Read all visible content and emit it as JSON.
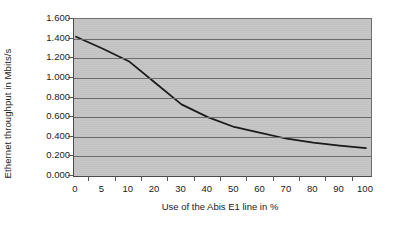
{
  "chart_data": {
    "type": "line",
    "title": "",
    "xlabel": "Use of the Abis E1 line in %",
    "ylabel": "Ethernet throughput in Mbits/s",
    "x": [
      0,
      5,
      10,
      20,
      30,
      40,
      50,
      60,
      70,
      80,
      90,
      100
    ],
    "xtick_labels": [
      "0",
      "5",
      "10",
      "20",
      "30",
      "40",
      "50",
      "60",
      "70",
      "80",
      "90",
      "100"
    ],
    "ytick_labels": [
      "1.600",
      "1.400",
      "1.200",
      "1.000",
      "0.800",
      "0.600",
      "0.400",
      "0.200",
      "0.000"
    ],
    "ytick_values": [
      1.6,
      1.4,
      1.2,
      1.0,
      0.8,
      0.6,
      0.4,
      0.2,
      0.0
    ],
    "ylim": [
      0.0,
      1.6
    ],
    "grid": "horizontal",
    "legend": "none",
    "series": [
      {
        "name": "Ethernet throughput",
        "values": [
          1.42,
          1.3,
          1.17,
          0.95,
          0.73,
          0.6,
          0.5,
          0.44,
          0.38,
          0.34,
          0.31,
          0.285
        ]
      }
    ],
    "colors": {
      "plot_background": "#c5c5c5",
      "gridline": "#6b6b6b",
      "line": "#1a1a1a",
      "axis": "#4a4a4a",
      "text": "#1b1b1b",
      "figure_background": "#ffffff"
    }
  }
}
